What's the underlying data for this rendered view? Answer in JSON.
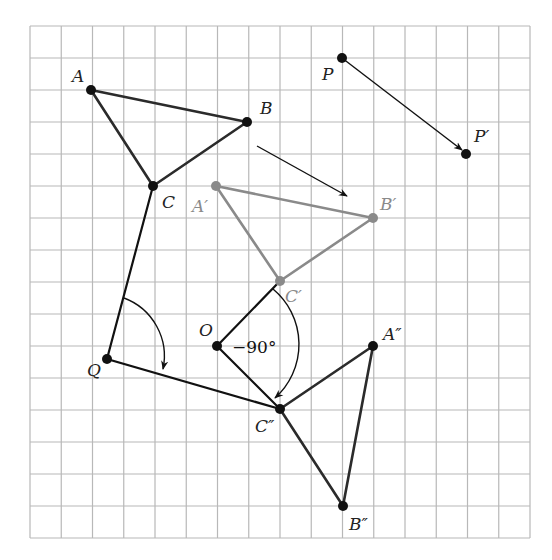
{
  "grid": {
    "left": 30,
    "top": 26,
    "right": 530,
    "bottom": 538,
    "cols": 16,
    "rows": 16,
    "color": "#b8b8b8"
  },
  "colors": {
    "dark": "#2b2b2b",
    "gray": "#8a8a8a",
    "black": "#111111"
  },
  "points": {
    "A": {
      "x": 91,
      "y": 90,
      "label": "A",
      "lx": 72,
      "ly": 82
    },
    "B": {
      "x": 247,
      "y": 122,
      "label": "B",
      "lx": 260,
      "ly": 114
    },
    "C": {
      "x": 153,
      "y": 186,
      "label": "C",
      "lx": 162,
      "ly": 208
    },
    "A1": {
      "x": 216,
      "y": 186,
      "label": "A′",
      "lx": 192,
      "ly": 212
    },
    "B1": {
      "x": 373,
      "y": 218,
      "label": "B′",
      "lx": 380,
      "ly": 210
    },
    "C1": {
      "x": 280,
      "y": 281,
      "label": "C′",
      "lx": 285,
      "ly": 302
    },
    "O": {
      "x": 217,
      "y": 346,
      "label": "O",
      "lx": 199,
      "ly": 336
    },
    "A2": {
      "x": 373,
      "y": 346,
      "label": "A″",
      "lx": 383,
      "ly": 340
    },
    "B2": {
      "x": 343,
      "y": 506,
      "label": "B″",
      "lx": 349,
      "ly": 530
    },
    "C2": {
      "x": 280,
      "y": 409,
      "label": "C″",
      "lx": 255,
      "ly": 432
    },
    "P": {
      "x": 342,
      "y": 58,
      "label": "P",
      "lx": 322,
      "ly": 80
    },
    "P1": {
      "x": 466,
      "y": 154,
      "label": "P′",
      "lx": 474,
      "ly": 142
    },
    "Q": {
      "x": 107,
      "y": 359,
      "label": "Q",
      "lx": 87,
      "ly": 376
    }
  },
  "angle_label": "−90°",
  "angle_label_pos": {
    "x": 232,
    "y": 353
  }
}
